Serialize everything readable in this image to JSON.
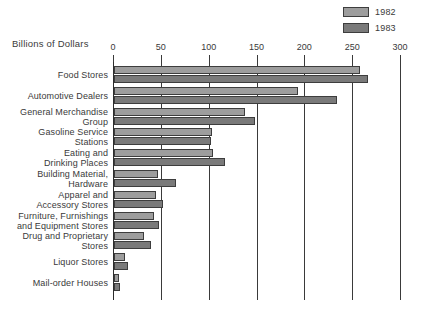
{
  "axis_title": "Billions of Dollars",
  "legend": {
    "items": [
      {
        "label": "1982",
        "color": "#9d9d9d"
      },
      {
        "label": "1983",
        "color": "#7a7a7a"
      }
    ]
  },
  "chart_data": {
    "type": "bar",
    "orientation": "horizontal",
    "title": "",
    "xlabel": "Billions of Dollars",
    "ylabel": "",
    "xlim": [
      0,
      300
    ],
    "xticks": [
      0,
      50,
      100,
      150,
      200,
      250,
      300
    ],
    "grid": true,
    "legend_position": "top-right",
    "categories": [
      "Food Stores",
      "Automotive Dealers",
      "General Merchandise Group",
      "Gasoline Service Stations",
      "Eating and Drinking Places",
      "Building Material, Hardware",
      "Apparel and Accessory Stores",
      "Furniture, Furnishings and Equipment Stores",
      "Drug and Proprietary Stores",
      "Liquor Stores",
      "Mail-order Houses"
    ],
    "category_lines": [
      [
        "Food Stores"
      ],
      [
        "Automotive Dealers"
      ],
      [
        "General Merchandise",
        "Group"
      ],
      [
        "Gasoline Service",
        "Stations"
      ],
      [
        "Eating and",
        "Drinking Places"
      ],
      [
        "Building Material,",
        "Hardware"
      ],
      [
        "Apparel and",
        "Accessory Stores"
      ],
      [
        "Furniture, Furnishings",
        "and Equipment Stores"
      ],
      [
        "Drug and Proprietary",
        "Stores"
      ],
      [
        "Liquor Stores"
      ],
      [
        "Mail-order Houses"
      ]
    ],
    "series": [
      {
        "name": "1982",
        "color": "#9d9d9d",
        "values": [
          257,
          192,
          137,
          102,
          103,
          46,
          44,
          42,
          31,
          12,
          5
        ]
      },
      {
        "name": "1983",
        "color": "#7a7a7a",
        "values": [
          266,
          233,
          147,
          101,
          116,
          65,
          51,
          47,
          39,
          15,
          6
        ]
      }
    ]
  }
}
